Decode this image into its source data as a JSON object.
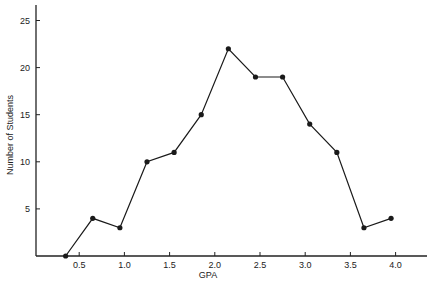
{
  "chart_data": {
    "type": "line",
    "title": "",
    "xlabel": "GPA",
    "ylabel": "Number of Students",
    "x": [
      0.35,
      0.65,
      0.95,
      1.25,
      1.55,
      1.85,
      2.15,
      2.45,
      2.75,
      3.05,
      3.35,
      3.65,
      3.95
    ],
    "series": [
      {
        "name": "Number of Students",
        "values": [
          0,
          4,
          3,
          10,
          11,
          15,
          22,
          19,
          19,
          14,
          11,
          3,
          4
        ],
        "marker": "circle",
        "color": "#1a1a1a"
      }
    ],
    "xticks": [
      0.5,
      1.0,
      1.5,
      2.0,
      2.5,
      3.0,
      3.5,
      4.0
    ],
    "xtick_labels": [
      "0.5",
      "1.0",
      "1.5",
      "2.0",
      "2.5",
      "3.0",
      "3.5",
      "4.0"
    ],
    "yticks": [
      5,
      10,
      15,
      20,
      25
    ],
    "ytick_labels": [
      "5",
      "10",
      "15",
      "20",
      "25"
    ],
    "xlim": [
      0,
      4.3
    ],
    "ylim": [
      0,
      26.5
    ],
    "grid": false,
    "legend": null
  }
}
